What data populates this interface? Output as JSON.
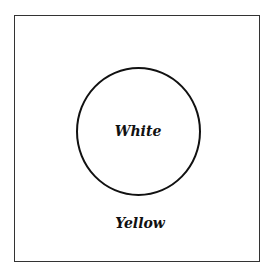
{
  "diagram": {
    "inner_region": {
      "shape": "circle",
      "label": "White"
    },
    "outer_region": {
      "shape": "square",
      "label": "Yellow"
    },
    "colors": {
      "stroke": "#111111",
      "frame": "#333333",
      "background": "#ffffff"
    }
  }
}
